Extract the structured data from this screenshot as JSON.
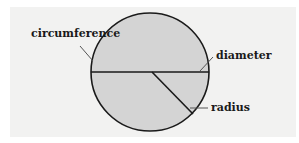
{
  "diagram": {
    "labels": {
      "circumference": "circumference",
      "diameter": "diameter",
      "radius": "radius"
    },
    "colors": {
      "background": "#f2f2f1",
      "circle_fill": "#d4d4d4",
      "stroke": "#1a1a1a"
    }
  }
}
